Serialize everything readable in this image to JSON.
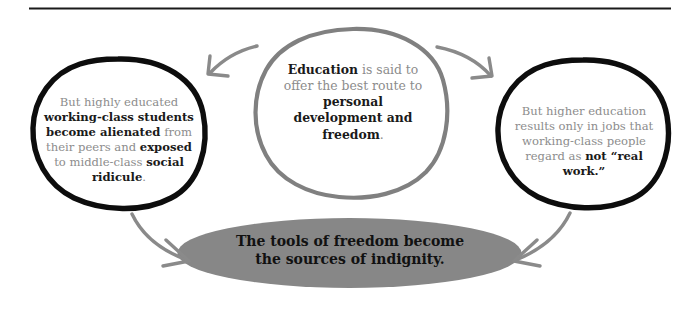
{
  "diagram": {
    "title_rule": "horizontal-rule",
    "background_color": "#ffffff",
    "nodes": {
      "center": {
        "id": "education-premise",
        "shape": "circle",
        "stroke_color": "#808080",
        "fill_color": "#ffffff",
        "text_plain": "Education is said to offer the best route to personal development and freedom.",
        "segments": [
          {
            "text": "Education",
            "bold": true
          },
          {
            "text": " is said to offer the best route to ",
            "bold": false
          },
          {
            "text": "personal development and freedom",
            "bold": true
          },
          {
            "text": ".",
            "bold": false
          }
        ]
      },
      "left": {
        "id": "alienation-outcome",
        "shape": "circle",
        "stroke_color": "#0d0d0d",
        "fill_color": "#ffffff",
        "text_plain": "But highly educated working-class students become alienated from their peers and exposed to middle-class social ridicule.",
        "segments": [
          {
            "text": "But highly educated ",
            "bold": false
          },
          {
            "text": "working-class students become alienated",
            "bold": true
          },
          {
            "text": " from their peers and ",
            "bold": false
          },
          {
            "text": "exposed",
            "bold": true
          },
          {
            "text": " to middle-class ",
            "bold": false
          },
          {
            "text": "social ridicule",
            "bold": true
          },
          {
            "text": ".",
            "bold": false
          }
        ]
      },
      "right": {
        "id": "not-real-work-outcome",
        "shape": "circle",
        "stroke_color": "#0d0d0d",
        "fill_color": "#ffffff",
        "text_plain": "But higher education results only in jobs that working-class people regard as not \"real work.\"",
        "segments": [
          {
            "text": "But higher education results only in jobs that working-class people regard as ",
            "bold": false
          },
          {
            "text": "not “real work.”",
            "bold": true
          }
        ]
      },
      "bottom": {
        "id": "conclusion",
        "shape": "ellipse",
        "stroke_color": "none",
        "fill_color": "#878787",
        "text_color": "#111111",
        "text_plain": "The tools of freedom become the sources of indignity.",
        "line1": "The tools of freedom become",
        "line2": "the sources of indignity."
      }
    },
    "arrows": [
      {
        "id": "arrow-center-to-left",
        "from": "center",
        "to": "left",
        "color": "#8a8a8a",
        "direction": "down-left"
      },
      {
        "id": "arrow-center-to-right",
        "from": "center",
        "to": "right",
        "color": "#8a8a8a",
        "direction": "down-right"
      },
      {
        "id": "arrow-left-to-bottom",
        "from": "left",
        "to": "bottom",
        "color": "#8a8a8a",
        "direction": "down-right"
      },
      {
        "id": "arrow-right-to-bottom",
        "from": "right",
        "to": "bottom",
        "color": "#8a8a8a",
        "direction": "down-left"
      }
    ]
  }
}
